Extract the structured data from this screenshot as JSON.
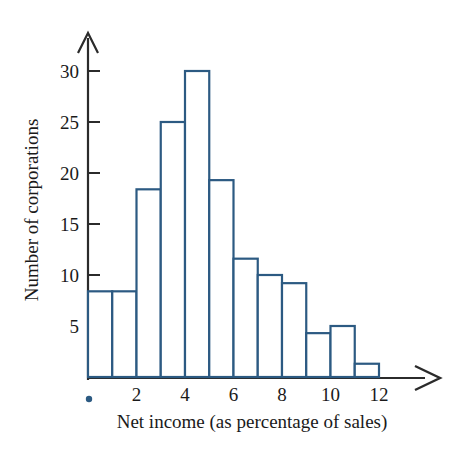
{
  "chart_data": {
    "type": "bar",
    "title": "",
    "subtitle": "",
    "xlabel": "Net income (as percentage of sales)",
    "ylabel": "Number of corporations",
    "categories": [
      "0-1",
      "1-2",
      "2-3",
      "3-4",
      "4-5",
      "5-6",
      "6-7",
      "7-8",
      "8-9",
      "9-10",
      "10-11",
      "11-12"
    ],
    "bin_edges": [
      0,
      1,
      2,
      3,
      4,
      5,
      6,
      7,
      8,
      9,
      10,
      11,
      12
    ],
    "values": [
      8.4,
      8.4,
      18.4,
      25,
      30,
      19.3,
      11.6,
      10,
      9.2,
      4.3,
      5,
      1.3
    ],
    "xlim": [
      0,
      12
    ],
    "ylim": [
      0,
      32
    ],
    "xticks": [
      2,
      4,
      6,
      8,
      10,
      12
    ],
    "xtick_labels": [
      "2",
      "4",
      "6",
      "8",
      "10",
      "12"
    ],
    "yticks": [
      5,
      10,
      15,
      20,
      25,
      30
    ],
    "ytick_labels": [
      "5",
      "10",
      "15",
      "20",
      "25",
      "30"
    ],
    "grid": false,
    "legend": false,
    "bar_style": "outline",
    "bar_stroke_color": "#2c5a82",
    "bar_fill_color": "#ffffff",
    "axis_color": "#2b2b2b",
    "text_color": "#1a1a1a",
    "background_color": "#ffffff",
    "axis_arrows": true,
    "marker_dot_color": "#2c5a82"
  }
}
